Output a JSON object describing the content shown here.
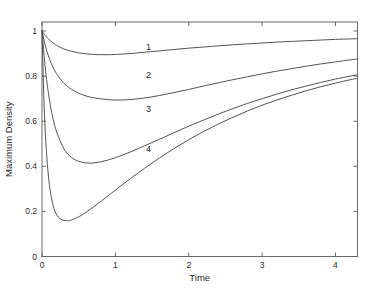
{
  "chart_data": {
    "type": "line",
    "title": "",
    "xlabel": "Time",
    "ylabel": "Maximum Density",
    "xlim": [
      0,
      4.3
    ],
    "ylim": [
      0,
      1.04
    ],
    "xticks": [
      0,
      1,
      2,
      3,
      4
    ],
    "xtick_labels": [
      "0",
      "1",
      "2",
      "3",
      "4"
    ],
    "yticks": [
      0,
      0.2,
      0.4,
      0.6,
      0.8,
      1
    ],
    "ytick_labels": [
      "0",
      "0.2",
      "0.4",
      "0.6",
      "0.8",
      "1"
    ],
    "grid": false,
    "legend_position": "inline-curve-labels",
    "box": true,
    "series": [
      {
        "name": "1",
        "label": "1",
        "label_x": 1.45,
        "label_y": 0.915,
        "x": [
          0,
          0.05,
          0.1,
          0.15,
          0.2,
          0.3,
          0.4,
          0.5,
          0.6,
          0.7,
          0.8,
          0.9,
          1.0,
          1.2,
          1.4,
          1.6,
          1.8,
          2.0,
          2.2,
          2.4,
          2.6,
          2.8,
          3.0,
          3.2,
          3.4,
          3.6,
          3.8,
          4.0,
          4.2,
          4.3
        ],
        "y": [
          1.0,
          0.978,
          0.961,
          0.947,
          0.936,
          0.92,
          0.91,
          0.903,
          0.899,
          0.896,
          0.895,
          0.895,
          0.896,
          0.9,
          0.906,
          0.912,
          0.918,
          0.924,
          0.929,
          0.934,
          0.939,
          0.943,
          0.947,
          0.951,
          0.954,
          0.957,
          0.96,
          0.963,
          0.965,
          0.966
        ]
      },
      {
        "name": "2",
        "label": "2",
        "label_x": 1.45,
        "label_y": 0.79,
        "x": [
          0,
          0.05,
          0.1,
          0.15,
          0.2,
          0.3,
          0.4,
          0.5,
          0.6,
          0.7,
          0.8,
          0.9,
          1.0,
          1.2,
          1.4,
          1.6,
          1.8,
          2.0,
          2.2,
          2.4,
          2.6,
          2.8,
          3.0,
          3.2,
          3.4,
          3.6,
          3.8,
          4.0,
          4.2,
          4.3
        ],
        "y": [
          1.0,
          0.93,
          0.878,
          0.84,
          0.81,
          0.768,
          0.742,
          0.724,
          0.712,
          0.704,
          0.699,
          0.696,
          0.694,
          0.696,
          0.703,
          0.714,
          0.727,
          0.741,
          0.756,
          0.77,
          0.784,
          0.797,
          0.81,
          0.822,
          0.833,
          0.844,
          0.854,
          0.863,
          0.872,
          0.876
        ]
      },
      {
        "name": "3",
        "label": "3",
        "label_x": 1.45,
        "label_y": 0.64,
        "x": [
          0,
          0.05,
          0.1,
          0.15,
          0.2,
          0.3,
          0.4,
          0.5,
          0.6,
          0.7,
          0.8,
          0.9,
          1.0,
          1.2,
          1.4,
          1.6,
          1.8,
          2.0,
          2.2,
          2.4,
          2.6,
          2.8,
          3.0,
          3.2,
          3.4,
          3.6,
          3.8,
          4.0,
          4.2,
          4.3
        ],
        "y": [
          1.0,
          0.82,
          0.698,
          0.612,
          0.552,
          0.477,
          0.44,
          0.422,
          0.415,
          0.415,
          0.42,
          0.428,
          0.438,
          0.463,
          0.491,
          0.52,
          0.549,
          0.578,
          0.605,
          0.631,
          0.656,
          0.679,
          0.7,
          0.72,
          0.739,
          0.756,
          0.772,
          0.787,
          0.8,
          0.806
        ]
      },
      {
        "name": "4",
        "label": "4",
        "label_x": 1.45,
        "label_y": 0.465,
        "x": [
          0,
          0.03,
          0.06,
          0.1,
          0.15,
          0.2,
          0.25,
          0.3,
          0.35,
          0.4,
          0.5,
          0.6,
          0.7,
          0.8,
          0.9,
          1.0,
          1.2,
          1.4,
          1.6,
          1.8,
          2.0,
          2.2,
          2.4,
          2.6,
          2.8,
          3.0,
          3.2,
          3.4,
          3.6,
          3.8,
          4.0,
          4.2,
          4.3
        ],
        "y": [
          1.0,
          0.66,
          0.47,
          0.32,
          0.228,
          0.185,
          0.167,
          0.16,
          0.159,
          0.162,
          0.176,
          0.196,
          0.219,
          0.244,
          0.269,
          0.294,
          0.344,
          0.392,
          0.437,
          0.479,
          0.518,
          0.554,
          0.587,
          0.617,
          0.645,
          0.671,
          0.694,
          0.715,
          0.735,
          0.753,
          0.769,
          0.784,
          0.79
        ]
      }
    ]
  },
  "axes": {
    "x_label": "Time",
    "y_label": "Maximum Density"
  },
  "colors": {
    "curve": "#4a4a4a",
    "axis": "#5a5a5a",
    "background": "#ffffff",
    "text": "#2b2b2b"
  }
}
